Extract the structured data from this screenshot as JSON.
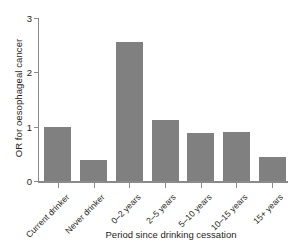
{
  "chart_data": {
    "type": "bar",
    "title": "",
    "subtitle": "",
    "xlabel": "Period since drinking cessation",
    "ylabel": "OR for oesophageal cancer",
    "categories": [
      "Current drinker",
      "Never drinker",
      "0–2 years",
      "2–5 years",
      "5–10 years",
      "10–15 years",
      "15+ years"
    ],
    "values": [
      1.0,
      0.39,
      2.55,
      1.13,
      0.89,
      0.9,
      0.45
    ],
    "ylim": [
      0,
      3
    ],
    "yticks": [
      0,
      1,
      2,
      3
    ],
    "ytick_labels": [
      "0",
      "1",
      "2",
      "3"
    ],
    "grid": false,
    "legend": false,
    "bar_color": "#808080",
    "axis_color": "#8a8a8a",
    "text_color": "#231f20",
    "background": "#ffffff"
  }
}
